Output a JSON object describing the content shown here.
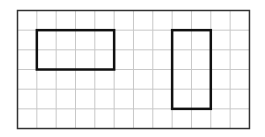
{
  "grid": {
    "columns": 12,
    "rows": 6,
    "origin_x": 17.5,
    "origin_y": 10.5,
    "cell_width": 19.33,
    "cell_height": 19.67,
    "line_color": "#c8c8c8",
    "border_color": "#333333"
  },
  "shapes": [
    {
      "name": "rectangle-left",
      "col": 1,
      "row": 1,
      "width_cells": 4,
      "height_cells": 2,
      "stroke": "#111111"
    },
    {
      "name": "rectangle-right",
      "col": 8,
      "row": 1,
      "width_cells": 2,
      "height_cells": 4,
      "stroke": "#111111"
    }
  ]
}
